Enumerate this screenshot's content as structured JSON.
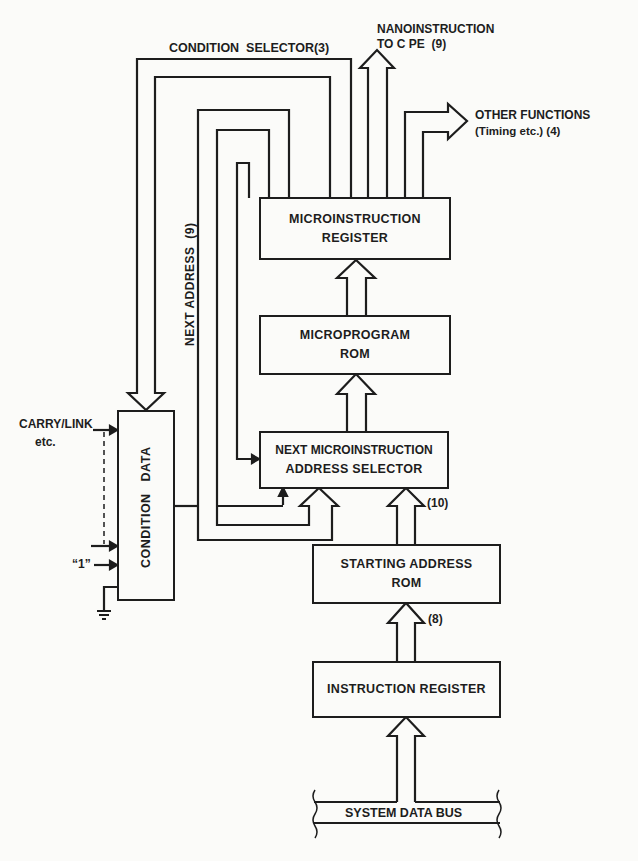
{
  "diagram": {
    "type": "microprogrammed control unit block diagram",
    "blocks": {
      "microinstruction_register": {
        "line1": "MICROINSTRUCTION",
        "line2": "REGISTER"
      },
      "microprogram_rom": {
        "line1": "MICROPROGRAM",
        "line2": "ROM"
      },
      "next_address_selector": {
        "line1": "NEXT MICROINSTRUCTION",
        "line2": "ADDRESS SELECTOR"
      },
      "condition_data": {
        "label": "CONDITION   DATA"
      },
      "starting_address_rom": {
        "line1": "STARTING ADDRESS",
        "line2": "ROM"
      },
      "instruction_register": {
        "label": "INSTRUCTION REGISTER"
      },
      "system_data_bus": {
        "label": "SYSTEM DATA BUS"
      }
    },
    "labels": {
      "condition_selector": "CONDITION  SELECTOR(3)",
      "nano_line1": "NANOINSTRUCTION",
      "nano_line2": "TO C PE  (9)",
      "other_line1": "OTHER FUNCTIONS",
      "other_line2": "(Timing etc.) (4)",
      "next_address": "NEXT ADDRESS  (9)",
      "carry_line1": "CARRY/LINK",
      "carry_line2": "etc.",
      "one_input": "“1”",
      "width_10": "(10)",
      "width_8": "(8)"
    },
    "connections": [
      {
        "from": "MICROINSTRUCTION REGISTER",
        "to": "CONDITION DATA",
        "label": "CONDITION SELECTOR(3)"
      },
      {
        "from": "MICROINSTRUCTION REGISTER",
        "to": "CPE",
        "label": "NANOINSTRUCTION TO CPE (9)"
      },
      {
        "from": "MICROINSTRUCTION REGISTER",
        "to": "OTHER FUNCTIONS",
        "label": "(Timing etc.) (4)"
      },
      {
        "from": "MICROINSTRUCTION REGISTER",
        "to": "NEXT MICROINSTRUCTION ADDRESS SELECTOR",
        "label": "NEXT ADDRESS (9)"
      },
      {
        "from": "MICROPROGRAM ROM",
        "to": "MICROINSTRUCTION REGISTER"
      },
      {
        "from": "NEXT MICROINSTRUCTION ADDRESS SELECTOR",
        "to": "MICROPROGRAM ROM"
      },
      {
        "from": "CONDITION DATA",
        "to": "NEXT MICROINSTRUCTION ADDRESS SELECTOR"
      },
      {
        "from": "STARTING ADDRESS ROM",
        "to": "NEXT MICROINSTRUCTION ADDRESS SELECTOR",
        "label": "(10)"
      },
      {
        "from": "INSTRUCTION REGISTER",
        "to": "STARTING ADDRESS ROM",
        "label": "(8)"
      },
      {
        "from": "SYSTEM DATA BUS",
        "to": "INSTRUCTION REGISTER"
      },
      {
        "from": "CARRY/LINK etc.",
        "to": "CONDITION DATA"
      },
      {
        "from": "\"1\"",
        "to": "CONDITION DATA"
      },
      {
        "from": "GROUND",
        "to": "CONDITION DATA"
      }
    ]
  }
}
